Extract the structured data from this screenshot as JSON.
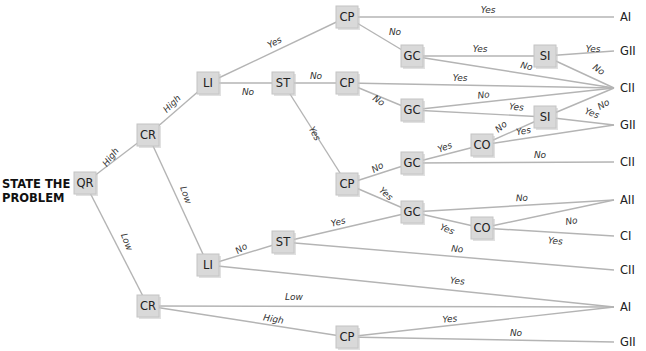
{
  "title": {
    "line1": "STATE THE",
    "line2": "PROBLEM"
  },
  "colors": {
    "edge": "#b4b4b4",
    "node_fill": "#d9d9d9",
    "node_stroke": "#c4c4c4",
    "text": "#222222"
  },
  "nodes": [
    {
      "id": "QR",
      "label": "QR",
      "x": 85,
      "y": 183
    },
    {
      "id": "CR1",
      "label": "CR",
      "x": 148,
      "y": 135
    },
    {
      "id": "LI1",
      "label": "LI",
      "x": 208,
      "y": 83
    },
    {
      "id": "ST1",
      "label": "ST",
      "x": 283,
      "y": 83
    },
    {
      "id": "CP1",
      "label": "CP",
      "x": 347,
      "y": 17
    },
    {
      "id": "GC1",
      "label": "GC",
      "x": 412,
      "y": 56
    },
    {
      "id": "SI1",
      "label": "SI",
      "x": 545,
      "y": 56
    },
    {
      "id": "CP2",
      "label": "CP",
      "x": 347,
      "y": 83
    },
    {
      "id": "GC2",
      "label": "GC",
      "x": 412,
      "y": 110
    },
    {
      "id": "SI2",
      "label": "SI",
      "x": 545,
      "y": 117
    },
    {
      "id": "CP3",
      "label": "CP",
      "x": 347,
      "y": 184
    },
    {
      "id": "GC3",
      "label": "GC",
      "x": 412,
      "y": 163
    },
    {
      "id": "CO1",
      "label": "CO",
      "x": 482,
      "y": 145
    },
    {
      "id": "GC4",
      "label": "GC",
      "x": 412,
      "y": 212
    },
    {
      "id": "CO2",
      "label": "CO",
      "x": 482,
      "y": 228
    },
    {
      "id": "ST2",
      "label": "ST",
      "x": 283,
      "y": 242
    },
    {
      "id": "LI2",
      "label": "LI",
      "x": 208,
      "y": 265
    },
    {
      "id": "CR2",
      "label": "CR",
      "x": 148,
      "y": 306
    },
    {
      "id": "CP4",
      "label": "CP",
      "x": 347,
      "y": 337
    }
  ],
  "outcomes": [
    {
      "id": "O1",
      "label": "AI",
      "x": 620,
      "y": 17
    },
    {
      "id": "O2",
      "label": "GII",
      "x": 620,
      "y": 51
    },
    {
      "id": "O3",
      "label": "CII",
      "x": 620,
      "y": 88
    },
    {
      "id": "O4",
      "label": "GII",
      "x": 620,
      "y": 125
    },
    {
      "id": "O5",
      "label": "CII",
      "x": 620,
      "y": 162
    },
    {
      "id": "O6",
      "label": "AII",
      "x": 620,
      "y": 200
    },
    {
      "id": "O7",
      "label": "CI",
      "x": 620,
      "y": 236
    },
    {
      "id": "O8",
      "label": "CII",
      "x": 620,
      "y": 270
    },
    {
      "id": "O9",
      "label": "AI",
      "x": 620,
      "y": 307
    },
    {
      "id": "O10",
      "label": "GII",
      "x": 620,
      "y": 342
    }
  ],
  "edges": [
    {
      "from": "QR",
      "to": "CR1",
      "label": "High",
      "lx": 113,
      "ly": 159,
      "rot": -52
    },
    {
      "from": "QR",
      "to": "CR2",
      "label": "Low",
      "lx": 124,
      "ly": 243,
      "rot": 68
    },
    {
      "from": "CR1",
      "to": "LI1",
      "label": "High",
      "lx": 174,
      "ly": 106,
      "rot": -45
    },
    {
      "from": "CR1",
      "to": "LI2",
      "label": "Low",
      "lx": 183,
      "ly": 196,
      "rot": 70
    },
    {
      "from": "LI1",
      "to": "CP1",
      "label": "Yes",
      "lx": 276,
      "ly": 45,
      "rot": -28
    },
    {
      "from": "LI1",
      "to": "ST1",
      "label": "No",
      "lx": 248,
      "ly": 95,
      "rot": 0
    },
    {
      "from": "CP1",
      "to": "O1",
      "label": "Yes",
      "lx": 488,
      "ly": 13,
      "rot": 0
    },
    {
      "from": "CP1",
      "to": "GC1",
      "label": "No",
      "lx": 395,
      "ly": 35,
      "rot": 0
    },
    {
      "from": "GC1",
      "to": "SI1",
      "label": "Yes",
      "lx": 480,
      "ly": 52,
      "rot": 0
    },
    {
      "from": "GC1",
      "to": "O3",
      "label": "No",
      "lx": 526,
      "ly": 69,
      "rot": 12
    },
    {
      "from": "SI1",
      "to": "O2",
      "label": "Yes",
      "lx": 593,
      "ly": 52,
      "rot": 0
    },
    {
      "from": "SI1",
      "to": "O3",
      "label": "No",
      "lx": 597,
      "ly": 72,
      "rot": 35
    },
    {
      "from": "ST1",
      "to": "CP2",
      "label": "No",
      "lx": 316,
      "ly": 79,
      "rot": 0
    },
    {
      "from": "ST1",
      "to": "CP3",
      "label": "Yes",
      "lx": 312,
      "ly": 135,
      "rot": 62
    },
    {
      "from": "CP2",
      "to": "O3",
      "label": "Yes",
      "lx": 460,
      "ly": 81,
      "rot": 0
    },
    {
      "from": "CP2",
      "to": "GC2",
      "label": "No",
      "lx": 377,
      "ly": 103,
      "rot": 35
    },
    {
      "from": "GC2",
      "to": "O3",
      "label": "No",
      "lx": 484,
      "ly": 98,
      "rot": -8
    },
    {
      "from": "GC2",
      "to": "SI2",
      "label": "Yes",
      "lx": 516,
      "ly": 110,
      "rot": 6
    },
    {
      "from": "SI2",
      "to": "O3",
      "label": "No",
      "lx": 605,
      "ly": 107,
      "rot": -30
    },
    {
      "from": "SI2",
      "to": "O4",
      "label": "Yes",
      "lx": 591,
      "ly": 116,
      "rot": 20
    },
    {
      "from": "CP3",
      "to": "GC3",
      "label": "No",
      "lx": 379,
      "ly": 170,
      "rot": -30
    },
    {
      "from": "CP3",
      "to": "GC4",
      "label": "Yes",
      "lx": 384,
      "ly": 196,
      "rot": 42
    },
    {
      "from": "GC3",
      "to": "CO1",
      "label": "Yes",
      "lx": 446,
      "ly": 150,
      "rot": -22
    },
    {
      "from": "GC3",
      "to": "O5",
      "label": "No",
      "lx": 540,
      "ly": 158,
      "rot": 0
    },
    {
      "from": "CO1",
      "to": "SI2",
      "label": "No",
      "lx": 503,
      "ly": 129,
      "rot": -40
    },
    {
      "from": "CO1",
      "to": "O4",
      "label": "Yes",
      "lx": 524,
      "ly": 134,
      "rot": -10
    },
    {
      "from": "GC4",
      "to": "O6",
      "label": "No",
      "lx": 522,
      "ly": 201,
      "rot": -3
    },
    {
      "from": "GC4",
      "to": "CO2",
      "label": "Yes",
      "lx": 446,
      "ly": 232,
      "rot": 22
    },
    {
      "from": "CO2",
      "to": "O6",
      "label": "No",
      "lx": 572,
      "ly": 224,
      "rot": -10
    },
    {
      "from": "CO2",
      "to": "O7",
      "label": "Yes",
      "lx": 555,
      "ly": 244,
      "rot": 5
    },
    {
      "from": "LI2",
      "to": "ST2",
      "label": "No",
      "lx": 243,
      "ly": 251,
      "rot": -33
    },
    {
      "from": "LI2",
      "to": "O9",
      "label": "Yes",
      "lx": 457,
      "ly": 284,
      "rot": 5
    },
    {
      "from": "ST2",
      "to": "GC4",
      "label": "Yes",
      "lx": 339,
      "ly": 225,
      "rot": -14
    },
    {
      "from": "ST2",
      "to": "O8",
      "label": "No",
      "lx": 457,
      "ly": 252,
      "rot": 5
    },
    {
      "from": "CR2",
      "to": "O9",
      "label": "Low",
      "lx": 294,
      "ly": 300,
      "rot": 0
    },
    {
      "from": "CR2",
      "to": "CP4",
      "label": "High",
      "lx": 273,
      "ly": 322,
      "rot": 10
    },
    {
      "from": "CP4",
      "to": "O9",
      "label": "Yes",
      "lx": 450,
      "ly": 322,
      "rot": -5
    },
    {
      "from": "CP4",
      "to": "O10",
      "label": "No",
      "lx": 516,
      "ly": 336,
      "rot": 0
    }
  ]
}
